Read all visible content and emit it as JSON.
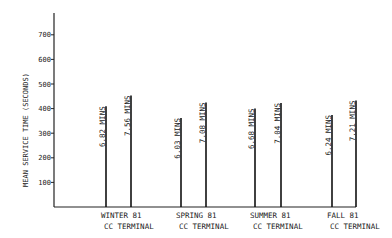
{
  "chart_data": {
    "type": "bar",
    "title": "",
    "xlabel": "",
    "ylabel": "MEAN SERVICE TIME (SECONDS)",
    "ylim": [
      0,
      800
    ],
    "yticks": [
      100,
      200,
      300,
      400,
      500,
      600,
      700
    ],
    "grid": false,
    "legend": null,
    "categories": [
      {
        "line1": "WINTER 81",
        "line2": "CC TERMINAL"
      },
      {
        "line1": "SPRING 81",
        "line2": "CC TERMINAL"
      },
      {
        "line1": "SUMMER 81",
        "line2": "CC TERMINAL"
      },
      {
        "line1": "FALL 81",
        "line2": "CC TERMINAL"
      }
    ],
    "series": [
      {
        "name": "first",
        "values": [
          409.2,
          361.8,
          400.8,
          374.4
        ],
        "labels": [
          "6.82 MINS",
          "6.03 MINS",
          "6.68 MINS",
          "6.24 MINS"
        ]
      },
      {
        "name": "second",
        "values": [
          453.6,
          424.8,
          422.4,
          432.6
        ],
        "labels": [
          "7.56 MINS",
          "7.08 MINS",
          "7.04 MINS",
          "7.21 MINS"
        ]
      }
    ]
  }
}
